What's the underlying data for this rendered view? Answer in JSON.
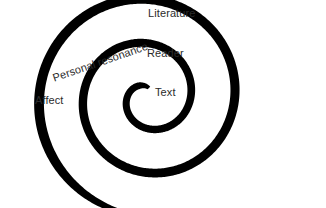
{
  "figure": {
    "name": "literature-reception-spiral-diagram",
    "width": 326,
    "height": 208,
    "background_color": "#ffffff"
  },
  "spiral": {
    "shape": "archimedean-spiral",
    "color": "#000000",
    "center_x": 148,
    "center_y": 97,
    "turns": 2.55,
    "start_angle_deg": -84,
    "direction": "counterclockwise",
    "inner_radius": 9,
    "radius_growth_per_turn": 44,
    "stroke_width_inner": 6.6,
    "stroke_width_outer": 10.2,
    "tail_taper": true,
    "tail_end_x": 305,
    "tail_end_y": 168
  },
  "labels": [
    {
      "id": "text",
      "text": "Text",
      "x": 155,
      "y": 91,
      "rotation": 0,
      "font_size": 11
    },
    {
      "id": "reader",
      "text": "Reader",
      "x": 147,
      "y": 52,
      "rotation": 0,
      "font_size": 11
    },
    {
      "id": "personal-resonance",
      "text": "Personal resonance",
      "x": 53,
      "y": 77,
      "rotation": -19,
      "font_size": 11
    },
    {
      "id": "affect",
      "text": "Affect",
      "x": 35,
      "y": 99,
      "rotation": 0,
      "font_size": 11
    },
    {
      "id": "literature",
      "text": "Literature",
      "x": 148,
      "y": 12,
      "rotation": 0,
      "font_size": 11
    }
  ]
}
